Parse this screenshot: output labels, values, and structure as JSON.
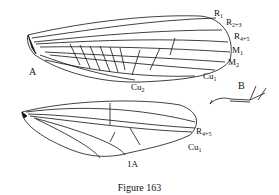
{
  "figure": {
    "caption": "Figure 163",
    "panels": {
      "A": "A",
      "B": "B"
    },
    "forewing_labels": {
      "r1": {
        "main": "R",
        "sub": "1"
      },
      "r23": {
        "main": "R",
        "sub": "2+3"
      },
      "r45": {
        "main": "R",
        "sub": "4+5"
      },
      "m1": {
        "main": "M",
        "sub": "1"
      },
      "m2": {
        "main": "M",
        "sub": "2"
      },
      "cu1": {
        "main": "Cu",
        "sub": "1"
      },
      "cu2": {
        "main": "Cu",
        "sub": "2"
      }
    },
    "hindwing_labels": {
      "r45": {
        "main": "R",
        "sub": "4+5"
      },
      "cu1": {
        "main": "Cu",
        "sub": "1"
      },
      "a1": "1A"
    },
    "colors": {
      "ink": "#111111",
      "background": "#ffffff"
    }
  }
}
